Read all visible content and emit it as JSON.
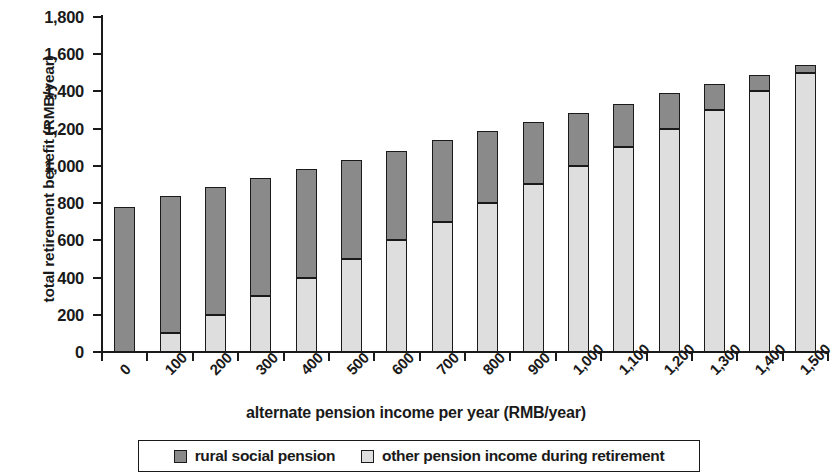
{
  "chart_data": {
    "type": "bar",
    "subtype": "stacked-vertical",
    "title": "",
    "xlabel": "alternate pension income per year (RMB/year)",
    "ylabel": "total retirement benefit (RMB/year)",
    "categories": [
      "0",
      "100",
      "200",
      "300",
      "400",
      "500",
      "600",
      "700",
      "800",
      "900",
      "1,000",
      "1,100",
      "1,200",
      "1,300",
      "1,400",
      "1,500"
    ],
    "ylim": [
      0,
      1800
    ],
    "ytick_labels": [
      "0",
      "200",
      "400",
      "600",
      "800",
      "1,000",
      "1,200",
      "1,400",
      "1,600",
      "1,800"
    ],
    "ytick_values": [
      0,
      200,
      400,
      600,
      800,
      1000,
      1200,
      1400,
      1600,
      1800
    ],
    "grid": false,
    "legend_position": "bottom",
    "stack_order": [
      "other pension income during retirement",
      "rural social pension"
    ],
    "series": [
      {
        "name": "other pension income during retirement",
        "color": "#dedede",
        "values": [
          0,
          100,
          200,
          300,
          400,
          500,
          600,
          700,
          800,
          900,
          1000,
          1100,
          1200,
          1300,
          1400,
          1500
        ]
      },
      {
        "name": "rural social pension",
        "color": "#8a8a8a",
        "values": [
          780,
          740,
          685,
          635,
          585,
          530,
          480,
          440,
          385,
          335,
          285,
          230,
          190,
          140,
          90,
          40
        ]
      }
    ],
    "totals": [
      780,
      840,
      885,
      935,
      985,
      1030,
      1080,
      1140,
      1185,
      1235,
      1285,
      1330,
      1390,
      1440,
      1490,
      1540
    ]
  },
  "legend": {
    "items": [
      {
        "label": "rural social pension",
        "color": "#8a8a8a"
      },
      {
        "label": "other pension income during retirement",
        "color": "#dedede"
      }
    ]
  }
}
